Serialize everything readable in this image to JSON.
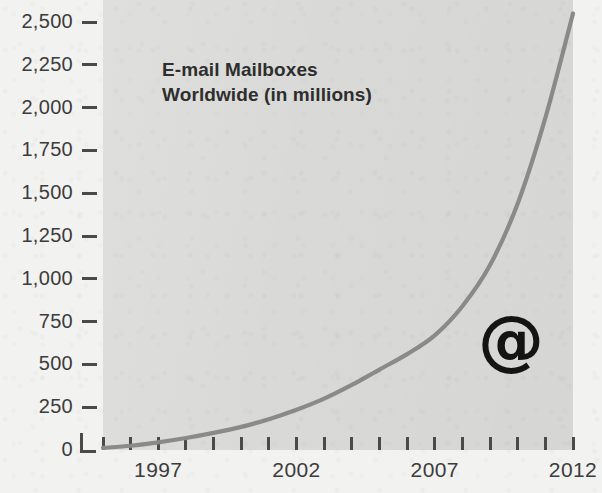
{
  "chart_data": {
    "type": "line",
    "title": "E-mail Mailboxes Worldwide (in millions)",
    "title_lines": [
      "E-mail Mailboxes",
      "Worldwide (in millions)"
    ],
    "xlabel": "",
    "ylabel": "",
    "ylim": [
      0,
      2600
    ],
    "xlim": [
      1995,
      2012
    ],
    "grid": false,
    "legend": false,
    "annotations": [
      {
        "name": "at-symbol",
        "text": "@",
        "x": 2009.4,
        "y": 620
      }
    ],
    "y_ticks": [
      0,
      250,
      500,
      750,
      1000,
      1250,
      1500,
      1750,
      2000,
      2250,
      2500
    ],
    "y_tick_labels": [
      "0",
      "250",
      "500",
      "750",
      "1,000",
      "1,250",
      "1,500",
      "1,750",
      "2,000",
      "2,250",
      "2,500"
    ],
    "x_ticks": [
      1995,
      1996,
      1997,
      1998,
      1999,
      2000,
      2001,
      2002,
      2003,
      2004,
      2005,
      2006,
      2007,
      2008,
      2009,
      2010,
      2011,
      2012
    ],
    "x_tick_labels_shown": [
      "1997",
      "2002",
      "2007",
      "2012"
    ],
    "x_tick_labels_shown_at": [
      1997,
      2002,
      2007,
      2012
    ],
    "x": [
      1995,
      1996,
      1997,
      1998,
      1999,
      2000,
      2001,
      2002,
      2003,
      2004,
      2005,
      2006,
      2007,
      2008,
      2009,
      2010,
      2011,
      2012
    ],
    "values": [
      12,
      25,
      45,
      70,
      100,
      135,
      180,
      235,
      300,
      380,
      470,
      560,
      670,
      840,
      1080,
      1440,
      1940,
      2550
    ],
    "series": [
      {
        "name": "E-mail mailboxes worldwide",
        "color": "#8a8a8a",
        "values": [
          12,
          25,
          45,
          70,
          100,
          135,
          180,
          235,
          300,
          380,
          470,
          560,
          670,
          840,
          1080,
          1440,
          1940,
          2550
        ]
      }
    ]
  },
  "colors": {
    "page_background": "#f2f2f0",
    "plot_background": "#d9dad7",
    "curve": "#8a8a8a",
    "axis": "#4a4a4a",
    "text": "#3c3c3c",
    "title_text": "#2e2e2e",
    "annotation": "#141414"
  }
}
